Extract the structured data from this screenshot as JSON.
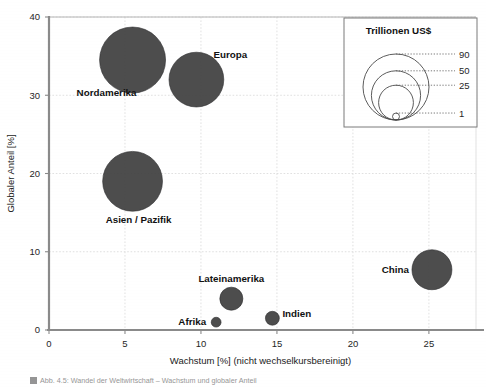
{
  "figure": {
    "caption": "Abb. 4.5: Wandel der Weltwirtschaft – Wachstum und globaler Anteil",
    "background": "#ffffff"
  },
  "colors": {
    "bubble_fill": "#3f3f40",
    "axis": "#8a8a8a",
    "grid": "#d9d9d9",
    "text": "#1a1a1a"
  },
  "axes": {
    "x": {
      "title": "Wachstum [%] (nicht wechselkursbereinigt)",
      "ticks": [
        0,
        5,
        10,
        15,
        20,
        25
      ],
      "min": 0,
      "max": 28.1
    },
    "y": {
      "title": "Globaler Anteil [%]",
      "ticks": [
        0,
        10,
        20,
        30,
        40
      ],
      "min": 0,
      "max": 40
    }
  },
  "legend": {
    "title": "Trillionen US$",
    "entries": [
      {
        "label": "90",
        "value": 90
      },
      {
        "label": "50",
        "value": 50
      },
      {
        "label": "25",
        "value": 25
      },
      {
        "label": "1",
        "value": 1
      }
    ]
  },
  "chart_data": {
    "type": "scatter",
    "title": "",
    "xlabel": "Wachstum [%] (nicht wechselkursbereinigt)",
    "ylabel": "Globaler Anteil [%]",
    "xlim": [
      0,
      28.1
    ],
    "ylim": [
      0,
      40
    ],
    "grid": true,
    "legend_position": "top-right",
    "size_unit": "Trillionen US$",
    "points": [
      {
        "name": "Nordamerika",
        "x": 5.5,
        "y": 34.5,
        "size": 90,
        "label_dx": -26,
        "label_dy": 36,
        "label_anchor": "middle"
      },
      {
        "name": "Europa",
        "x": 9.7,
        "y": 32.0,
        "size": 62,
        "label_dx": 34,
        "label_dy": -22,
        "label_anchor": "middle"
      },
      {
        "name": "Asien / Pazifik",
        "x": 5.5,
        "y": 19.0,
        "size": 74,
        "label_dx": 6,
        "label_dy": 42,
        "label_anchor": "middle"
      },
      {
        "name": "Lateinamerika",
        "x": 12.0,
        "y": 4.0,
        "size": 11,
        "label_dx": 0,
        "label_dy": -17,
        "label_anchor": "middle"
      },
      {
        "name": "Afrika",
        "x": 11.0,
        "y": 1.0,
        "size": 2,
        "label_dx": -10,
        "label_dy": 3,
        "label_anchor": "end"
      },
      {
        "name": "Indien",
        "x": 14.7,
        "y": 1.5,
        "size": 4,
        "label_dx": 10,
        "label_dy": -1,
        "label_anchor": "start"
      },
      {
        "name": "China",
        "x": 25.2,
        "y": 7.7,
        "size": 33,
        "label_dx": -23,
        "label_dy": 3,
        "label_anchor": "end"
      }
    ]
  }
}
